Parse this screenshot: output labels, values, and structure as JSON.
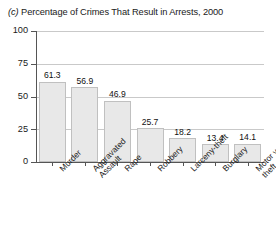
{
  "chart_data": {
    "type": "bar",
    "title": "(c) Percentage of Crimes That Result in Arrests, 2000",
    "title_prefix": "(c)",
    "title_text": "Percentage of Crimes That Result in Arrests, 2000",
    "xlabel": "",
    "ylabel": "",
    "ylim": [
      0,
      100
    ],
    "yticks": [
      0,
      25,
      50,
      75,
      100
    ],
    "grid": true,
    "legend": "none",
    "categories": [
      "Murder",
      "Aggravated Assault",
      "Rape",
      "Robbery",
      "Larceny-theft",
      "Burglary",
      "Motor vehicle theft"
    ],
    "category_lines": [
      [
        "Murder"
      ],
      [
        "Aggravated",
        "Assault"
      ],
      [
        "Rape"
      ],
      [
        "Robbery"
      ],
      [
        "Larceny-theft"
      ],
      [
        "Burglary"
      ],
      [
        "Motor vehicle",
        "theft"
      ]
    ],
    "values": [
      61.3,
      56.9,
      46.9,
      25.7,
      18.2,
      13.4,
      14.1
    ],
    "value_labels": [
      "61.3",
      "56.9",
      "46.9",
      "25.7",
      "18.2",
      "13.4",
      "14.1"
    ],
    "bar_color": "#e8e8e8",
    "bar_edge_color": "#c0c0c0",
    "axis_color": "#555555",
    "grid_color": "#c9c9c9"
  },
  "ytick_labels": [
    "100",
    "75",
    "50",
    "25",
    "0"
  ]
}
